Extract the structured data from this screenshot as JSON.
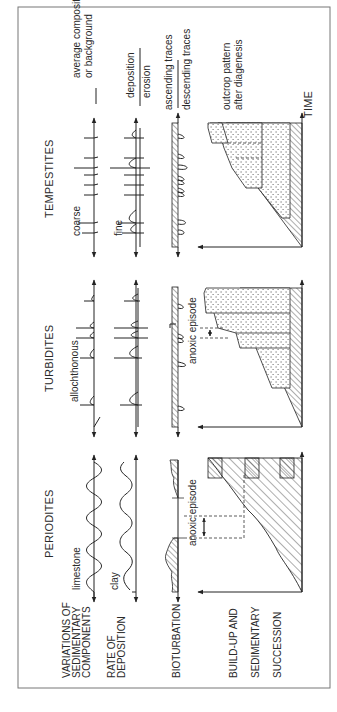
{
  "figure": {
    "orientation": "rotated-90-ccw",
    "columns": [
      {
        "id": "periodites",
        "title": "PERIODITES"
      },
      {
        "id": "turbidites",
        "title": "TURBIDITES"
      },
      {
        "id": "tempestites",
        "title": "TEMPESTITES"
      }
    ],
    "row_labels": {
      "variations": [
        "VARIATIONS OF",
        "SEDIMENTARY",
        "COMPONENTS"
      ],
      "rate": [
        "RATE OF",
        "DEPOSITION"
      ],
      "bioturbation": [
        "BIOTURBATION"
      ],
      "buildup": [
        "BUILD-UP AND",
        "SEDIMENTARY",
        "SUCCESSION"
      ]
    },
    "periodites": {
      "limestone_label": "limestone",
      "clay_label": "clay",
      "anoxic_label": "anoxic episode"
    },
    "turbidites": {
      "allochthonous_label": "allochthonous",
      "anoxic_label": "anoxic episode"
    },
    "tempestites": {
      "coarse_label": "coarse",
      "fine_label": "fine",
      "legend_background": [
        "average composition",
        "or background"
      ],
      "legend_deposition": "deposition",
      "legend_erosion": "erosion",
      "legend_ascending": "ascending traces",
      "legend_descending": "descending traces",
      "outcrop_label": [
        "outcrop pattern",
        "after diagenesis"
      ],
      "time_label": "TIME"
    },
    "colors": {
      "ink": "#222222",
      "frame": "#777777",
      "background": "#ffffff"
    }
  }
}
